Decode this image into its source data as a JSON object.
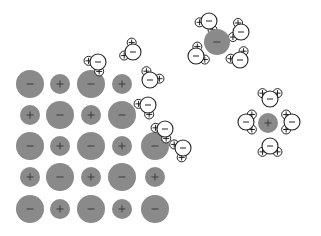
{
  "diagram": {
    "colors": {
      "ion_fill": "#8a8a8a",
      "ion_sign": "#3a3a3a",
      "water_stroke": "#222222",
      "water_fill": "#ffffff",
      "background": "#ffffff"
    },
    "symbols": {
      "anion": "−",
      "cation": "+",
      "oxygen": "−",
      "hydrogen": "+"
    },
    "lattice": {
      "rows": [
        [
          "-",
          "+",
          "-",
          "+"
        ],
        [
          "+",
          "-",
          "+",
          "-"
        ],
        [
          "-",
          "+",
          "-",
          "+",
          "-"
        ],
        [
          "+",
          "-",
          "+",
          "-",
          "+"
        ],
        [
          "-",
          "+",
          "-",
          "+",
          "-"
        ]
      ],
      "col_x": [
        30,
        60,
        91,
        122,
        155
      ],
      "row_y": [
        84,
        115,
        146,
        177,
        209
      ],
      "anion_radius": 14,
      "cation_radius": 10
    },
    "lattice_waters": [
      {
        "x": 98,
        "y": 62,
        "angle": 135
      },
      {
        "x": 133,
        "y": 52,
        "angle": 210
      },
      {
        "x": 150,
        "y": 80,
        "angle": 300
      },
      {
        "x": 148,
        "y": 105,
        "angle": 135
      },
      {
        "x": 165,
        "y": 129,
        "angle": 135
      },
      {
        "x": 183,
        "y": 148,
        "angle": 150
      }
    ],
    "hydrated_anion": {
      "ion": {
        "x": 217,
        "y": 42,
        "r": 13,
        "sign": "-"
      },
      "waters": [
        {
          "x": 209,
          "y": 21,
          "angle": 120
        },
        {
          "x": 241,
          "y": 32,
          "angle": 200
        },
        {
          "x": 196,
          "y": 56,
          "angle": 330
        },
        {
          "x": 240,
          "y": 60,
          "angle": 240
        }
      ]
    },
    "hydrated_cation": {
      "ion": {
        "x": 268,
        "y": 123,
        "r": 10,
        "sign": "+"
      },
      "waters": [
        {
          "x": 270,
          "y": 99,
          "angle": 270
        },
        {
          "x": 246,
          "y": 122,
          "angle": 0
        },
        {
          "x": 292,
          "y": 122,
          "angle": 180
        },
        {
          "x": 270,
          "y": 146,
          "angle": 90
        }
      ]
    }
  }
}
